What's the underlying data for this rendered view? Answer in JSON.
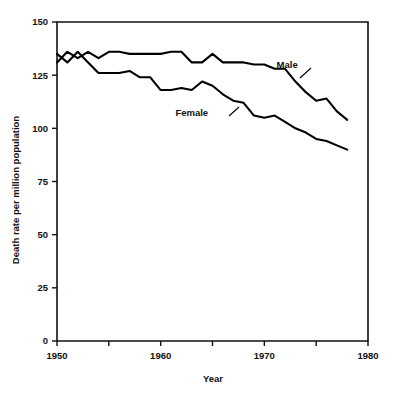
{
  "chart_data": {
    "type": "line",
    "title": "",
    "xlabel": "Year",
    "ylabel": "Death rate per million population",
    "xlim": [
      1950,
      1980
    ],
    "ylim": [
      0,
      150
    ],
    "grid": false,
    "legend_position": "inline-annotations",
    "xticks": [
      1950,
      1960,
      1970,
      1980
    ],
    "xtick_labels": [
      "1950",
      "1960",
      "1970",
      "1980"
    ],
    "xminorticks": [
      1955,
      1965,
      1975
    ],
    "yticks": [
      0,
      25,
      50,
      75,
      100,
      125,
      150
    ],
    "ytick_labels": [
      "0",
      "25",
      "50",
      "75",
      "100",
      "125",
      "150"
    ],
    "x": [
      1950,
      1951,
      1952,
      1953,
      1954,
      1955,
      1956,
      1957,
      1958,
      1959,
      1960,
      1961,
      1962,
      1963,
      1964,
      1965,
      1966,
      1967,
      1968,
      1969,
      1970,
      1971,
      1972,
      1973,
      1974,
      1975,
      1976,
      1977,
      1978
    ],
    "series": [
      {
        "name": "Male",
        "label": "Male",
        "color": "#000000",
        "values": [
          131,
          136,
          133,
          136,
          133,
          136,
          136,
          135,
          135,
          135,
          135,
          136,
          136,
          131,
          131,
          135,
          131,
          131,
          131,
          130,
          130,
          128,
          128,
          122,
          117,
          113,
          114,
          108,
          104
        ]
      },
      {
        "name": "Female",
        "label": "Female",
        "color": "#000000",
        "values": [
          135,
          131,
          136,
          131,
          126,
          126,
          126,
          127,
          124,
          124,
          118,
          118,
          119,
          118,
          122,
          120,
          116,
          113,
          112,
          106,
          105,
          106,
          103,
          100,
          98,
          95,
          94,
          92,
          90
        ]
      }
    ],
    "annotations": [
      {
        "text": "Male",
        "x": 1972.2,
        "y": 128.5
      },
      {
        "text": "Female",
        "x": 1963.0,
        "y": 106.0
      }
    ]
  },
  "axes": {
    "x_axis_label": "Year",
    "y_axis_label": "Death rate per million population"
  }
}
